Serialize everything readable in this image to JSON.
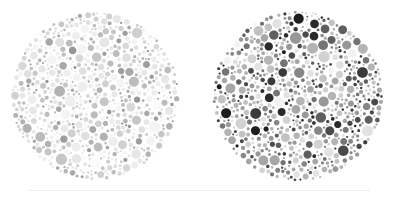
{
  "figure": {
    "kind": "ishihara-color-vision-test-plates",
    "caption": "",
    "background_color": "#ffffff",
    "width": 398,
    "height": 204
  },
  "separator": {
    "color": "#ececec",
    "x": 28,
    "y": 190,
    "width": 342,
    "height": 1
  },
  "plates": [
    {
      "name": "left-plate",
      "label": "",
      "center_x": 95,
      "center_y": 96,
      "radius": 85,
      "contrast": "low",
      "background_color": "#ffffff",
      "dot_colors": [
        "#fbfbfb",
        "#f4f4f4",
        "#eeeeee",
        "#e7e7e7",
        "#e0e0e0",
        "#d8d8d8",
        "#d0d0d0",
        "#c6c6c6",
        "#bcbcbc",
        "#b2b2b2",
        "#a8a8a8",
        "#9e9e9e",
        "#969696"
      ],
      "dot_color_weights": [
        6,
        9,
        11,
        12,
        12,
        11,
        10,
        8,
        7,
        5,
        4,
        3,
        2
      ],
      "dot_count": 1150,
      "dot_radius_min": 1.0,
      "dot_radius_max": 5.6,
      "seed": 20240117
    },
    {
      "name": "right-plate",
      "label": "",
      "center_x": 298,
      "center_y": 96,
      "radius": 86,
      "contrast": "high",
      "background_color": "#ffffff",
      "dot_colors": [
        "#f2f2f2",
        "#e2e2e2",
        "#d2d2d2",
        "#c2c2c2",
        "#b4b4b4",
        "#a6a6a6",
        "#989898",
        "#868686",
        "#747474",
        "#5e5e5e",
        "#4a4a4a",
        "#3a3a3a",
        "#2a2a2a",
        "#1e1e1e"
      ],
      "dot_color_weights": [
        4,
        6,
        8,
        10,
        11,
        11,
        10,
        9,
        8,
        7,
        6,
        5,
        4,
        3
      ],
      "dot_count": 1150,
      "dot_radius_min": 1.0,
      "dot_radius_max": 5.9,
      "seed": 77310294
    }
  ]
}
